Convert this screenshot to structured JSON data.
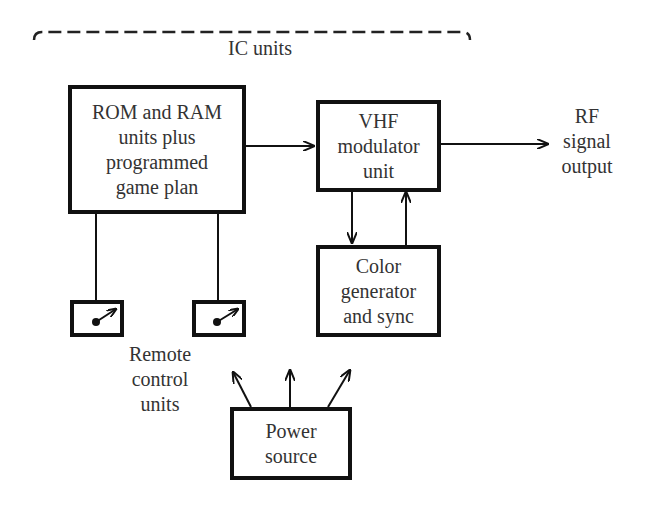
{
  "diagram": {
    "group_label": "IC units",
    "blocks": {
      "rom_ram": {
        "lines": [
          "ROM and RAM",
          "units plus",
          "programmed",
          "game plan"
        ]
      },
      "vhf": {
        "lines": [
          "VHF",
          "modulator",
          "unit"
        ]
      },
      "color": {
        "lines": [
          "Color",
          "generator",
          "and sync"
        ]
      },
      "power": {
        "lines": [
          "Power",
          "source"
        ]
      }
    },
    "output_label": [
      "RF",
      "signal",
      "output"
    ],
    "remote_label": [
      "Remote",
      "control",
      "units"
    ],
    "remote_units": 2,
    "connections": [
      {
        "from": "rom_ram",
        "to": "vhf",
        "type": "arrow"
      },
      {
        "from": "vhf",
        "to": "rf_output",
        "type": "arrow"
      },
      {
        "from": "vhf",
        "to": "color",
        "type": "arrow"
      },
      {
        "from": "color",
        "to": "vhf",
        "type": "arrow"
      },
      {
        "from": "rom_ram",
        "to": "remote_1",
        "type": "line"
      },
      {
        "from": "rom_ram",
        "to": "remote_2",
        "type": "line"
      },
      {
        "from": "power",
        "to": "system",
        "type": "arrows x3"
      }
    ]
  }
}
